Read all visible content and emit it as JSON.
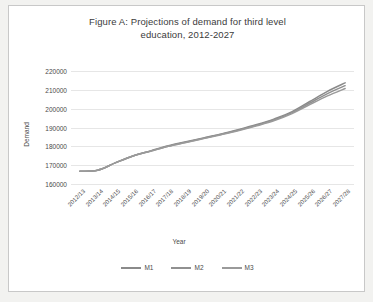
{
  "chart_data": {
    "type": "line",
    "title": "Figure A:  Projections of demand for third level education, 2012-2027",
    "title_line1": "Figure A:  Projections of demand for third level",
    "title_line2": "education, 2012-2027",
    "xlabel": "Year",
    "ylabel": "Demand",
    "ylim": [
      160000,
      220000
    ],
    "ytick_values": [
      220000,
      210000,
      200000,
      190000,
      180000,
      170000,
      160000
    ],
    "ytick_labels": [
      "220000",
      "210000",
      "200000",
      "190000",
      "180000",
      "170000",
      "160000"
    ],
    "grid": true,
    "legend_position": "bottom",
    "line_color": "#808080",
    "categories": [
      "2012/13",
      "2013/14",
      "2014/15",
      "2015/16",
      "2016/17",
      "2017/18",
      "2018/19",
      "2019/20",
      "2020/21",
      "2021/22",
      "2022/23",
      "2023/24",
      "2024/25",
      "2025/26",
      "2026/27",
      "2027/28"
    ],
    "series": [
      {
        "name": "M1",
        "color": "#8a8a8a",
        "values": [
          166800,
          167300,
          171200,
          174900,
          177600,
          180300,
          182400,
          184500,
          186600,
          189000,
          191600,
          194600,
          198400,
          203800,
          209200,
          213700
        ]
      },
      {
        "name": "M2",
        "color": "#909090",
        "values": [
          166800,
          167300,
          171200,
          174900,
          177500,
          180100,
          182200,
          184300,
          186400,
          188700,
          191200,
          194100,
          197900,
          203000,
          208000,
          212200
        ]
      },
      {
        "name": "M3",
        "color": "#9a9a9a",
        "values": [
          166800,
          167300,
          171200,
          174900,
          177400,
          180000,
          182000,
          184100,
          186200,
          188400,
          190900,
          193700,
          197400,
          202200,
          206800,
          210700
        ]
      }
    ]
  }
}
